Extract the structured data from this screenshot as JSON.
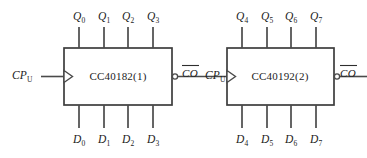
{
  "diagram": {
    "background_color": "#ffffff",
    "line_color": "#4a4a4a",
    "text_color": "#1c1c1c",
    "chips": [
      {
        "id": "chip1",
        "label": "CC40182(1)",
        "clock_input": {
          "name": "CP",
          "subscript": "U"
        },
        "carry_output": {
          "name": "CO",
          "overbar": true,
          "inverted_bubble": true
        },
        "outputs": [
          {
            "name": "Q",
            "subscript": "0"
          },
          {
            "name": "Q",
            "subscript": "1"
          },
          {
            "name": "Q",
            "subscript": "2"
          },
          {
            "name": "Q",
            "subscript": "3"
          }
        ],
        "inputs": [
          {
            "name": "D",
            "subscript": "0"
          },
          {
            "name": "D",
            "subscript": "1"
          },
          {
            "name": "D",
            "subscript": "2"
          },
          {
            "name": "D",
            "subscript": "3"
          }
        ]
      },
      {
        "id": "chip2",
        "label": "CC40192(2)",
        "clock_input": {
          "name": "CP",
          "subscript": "U"
        },
        "carry_output": {
          "name": "CO",
          "overbar": true,
          "inverted_bubble": true
        },
        "outputs": [
          {
            "name": "Q",
            "subscript": "4"
          },
          {
            "name": "Q",
            "subscript": "5"
          },
          {
            "name": "Q",
            "subscript": "6"
          },
          {
            "name": "Q",
            "subscript": "7"
          }
        ],
        "inputs": [
          {
            "name": "D",
            "subscript": "4"
          },
          {
            "name": "D",
            "subscript": "5"
          },
          {
            "name": "D",
            "subscript": "6"
          },
          {
            "name": "D",
            "subscript": "7"
          }
        ]
      }
    ],
    "external_clock": {
      "name": "CP",
      "subscript": "U"
    },
    "final_carry": {
      "name": "CO",
      "overbar": true
    }
  }
}
